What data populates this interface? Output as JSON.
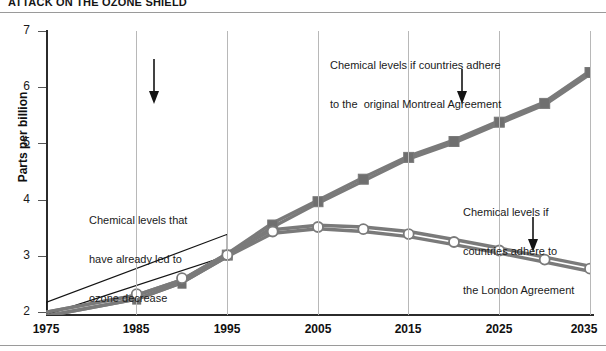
{
  "title": "ATTACK ON THE OZONE SHIELD",
  "chart_data": {
    "type": "line",
    "title": "ATTACK ON THE OZONE SHIELD",
    "xlabel": "",
    "ylabel": "Parts per billion",
    "xlim": [
      1975,
      2035
    ],
    "ylim": [
      2,
      7
    ],
    "yticks": [
      2,
      3,
      4,
      5,
      6,
      7
    ],
    "xticks": [
      1975,
      1985,
      1995,
      2005,
      2015,
      2025,
      2035
    ],
    "ytick_labels": [
      "2",
      "3",
      "4",
      "5",
      "6",
      "7"
    ],
    "xtick_labels": [
      "1975",
      "1985",
      "1995",
      "2005",
      "2015",
      "2025",
      "2035"
    ],
    "grid": "vertical-only",
    "legend": "none-inline-annotations",
    "x": [
      1975,
      1985,
      1990,
      1995,
      2000,
      2005,
      2010,
      2015,
      2020,
      2025,
      2030,
      2035
    ],
    "series": [
      {
        "name": "Chemical levels if countries adhere to the original Montreal Agreement",
        "marker": "filled-square",
        "marker_color": "#6f6f6f",
        "line_color": "#7a7a7a",
        "band": true,
        "values_upper": [
          2.05,
          2.35,
          2.62,
          3.08,
          3.62,
          4.02,
          4.42,
          4.8,
          5.08,
          5.42,
          5.75,
          6.3
        ],
        "values_lower": [
          1.98,
          2.28,
          2.57,
          3.03,
          3.55,
          3.97,
          4.36,
          4.75,
          5.03,
          5.37,
          5.7,
          6.24
        ]
      },
      {
        "name": "Chemical levels if countries adhere to the London Agreement",
        "marker": "open-circle",
        "marker_color": "#ffffff",
        "line_color": "#7a7a7a",
        "band": true,
        "values_upper": [
          2.05,
          2.35,
          2.62,
          3.08,
          3.5,
          3.58,
          3.55,
          3.47,
          3.33,
          3.18,
          3.02,
          2.86
        ],
        "values_lower": [
          1.98,
          2.28,
          2.57,
          3.03,
          3.44,
          3.52,
          3.47,
          3.38,
          3.24,
          3.09,
          2.93,
          2.77
        ]
      }
    ],
    "shapes": [
      {
        "name": "historic-band-outline",
        "type": "polygon-outline",
        "color": "#141414",
        "points": [
          [
            1975,
            2.22
          ],
          [
            1995,
            3.42
          ],
          [
            1995,
            3.04
          ],
          [
            1975,
            2.0
          ]
        ]
      }
    ],
    "annotations": [
      {
        "id": "historic",
        "text": "Chemical levels that\nhave already led to\nozone decrease",
        "arrow": "down",
        "arrow_target_year": 1992
      },
      {
        "id": "montreal",
        "text": "Chemical levels if countries adhere\nto the  original Montreal Agreement",
        "arrow": "down",
        "arrow_target_year": 2023
      },
      {
        "id": "london",
        "text": "Chemical levels if\ncountries adhere to\nthe London Agreement",
        "arrow": "down",
        "arrow_target_year": 2031
      }
    ]
  },
  "axis": {
    "ylabel": "Parts per billion",
    "ytick_labels": [
      "7",
      "6",
      "5",
      "4",
      "3",
      "2"
    ],
    "xtick_labels": [
      "1975",
      "1985",
      "1995",
      "2005",
      "2015",
      "2025",
      "2035"
    ]
  },
  "annotations": {
    "historic": {
      "line1": "Chemical levels that",
      "line2": "have already led to",
      "line3": "ozone decrease"
    },
    "montreal": {
      "line1": "Chemical levels if countries adhere",
      "line2": "to the  original Montreal Agreement"
    },
    "london": {
      "line1": "Chemical levels if",
      "line2": "countries adhere to",
      "line3": "the London Agreement"
    }
  },
  "colors": {
    "series_line": "#7a7a7a",
    "square_marker": "#6f6f6f",
    "circle_marker_fill": "#ffffff",
    "axis": "#2b2b2b",
    "gridline": "#b8b8b8",
    "text": "#141414"
  }
}
